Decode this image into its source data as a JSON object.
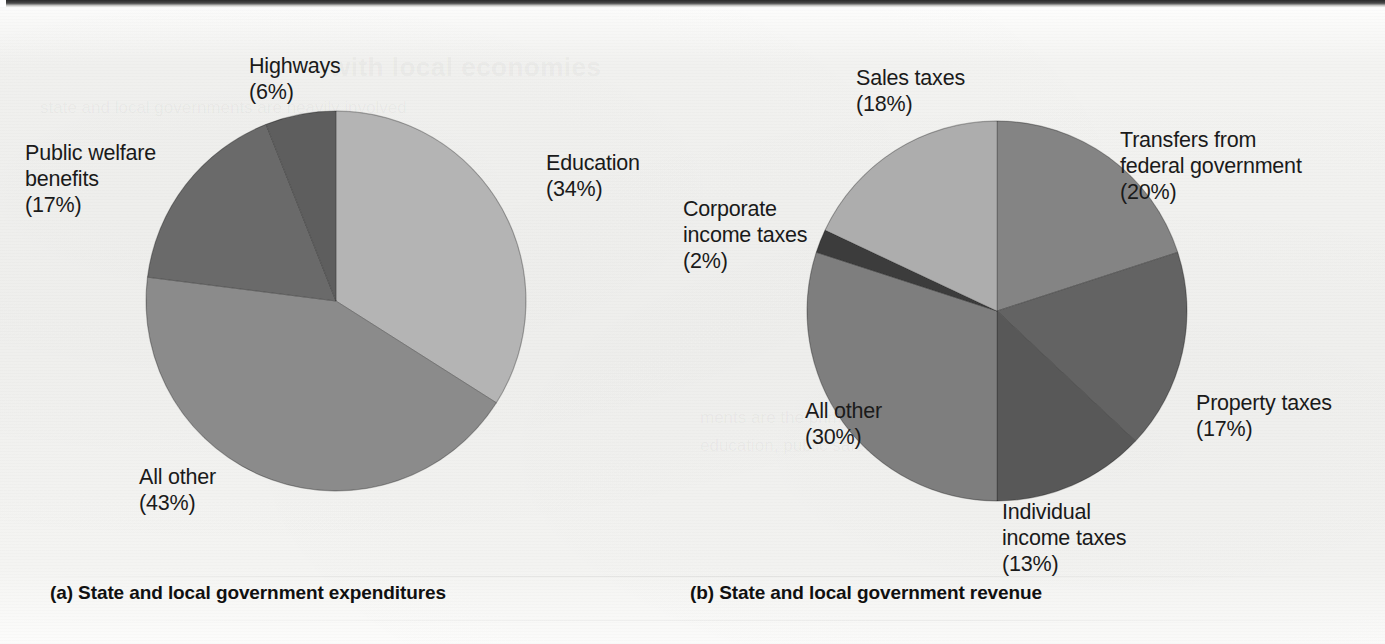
{
  "figure": {
    "background_color": "#f1f1ef",
    "ghost_heading": "with local economies",
    "ghost_line_1": "state and local governments are heavily involved",
    "ghost_line_2": "ments are the primary providers of",
    "ghost_line_3": "education, public safety, and highways."
  },
  "charts": [
    {
      "id": "expenditures",
      "caption_marker": "(a)",
      "caption_text": "State and local government expenditures",
      "center": {
        "x": 336,
        "y": 301
      },
      "radius": 190,
      "chart_data": {
        "type": "pie",
        "title": "(a) State and local government expenditures",
        "categories": [
          "Education",
          "All other",
          "Public welfare benefits",
          "Highways"
        ],
        "values": [
          34,
          43,
          17,
          6
        ],
        "unit": "%",
        "start_angle_deg": 0,
        "direction": "clockwise",
        "colors": [
          "#b4b4b4",
          "#8b8b8b",
          "#6a6a6a",
          "#5e5e5e"
        ],
        "labels": [
          {
            "name": "Education",
            "value": 34,
            "text": "Education\n(34%)"
          },
          {
            "name": "All other",
            "value": 43,
            "text": "All other\n(43%)"
          },
          {
            "name": "Public welfare benefits",
            "value": 17,
            "text": "Public welfare\nbenefits\n(17%)"
          },
          {
            "name": "Highways",
            "value": 6,
            "text": "Highways\n(6%)"
          }
        ]
      }
    },
    {
      "id": "revenue",
      "caption_marker": "(b)",
      "caption_text": "State and local government revenue",
      "center": {
        "x": 997,
        "y": 311
      },
      "radius": 190,
      "chart_data": {
        "type": "pie",
        "title": "(b) State and local government revenue",
        "categories": [
          "Transfers from federal government",
          "Property taxes",
          "Individual income taxes",
          "All other",
          "Corporate income taxes",
          "Sales taxes"
        ],
        "values": [
          20,
          17,
          13,
          30,
          2,
          18
        ],
        "unit": "%",
        "start_angle_deg": 0,
        "direction": "clockwise",
        "colors": [
          "#848484",
          "#636363",
          "#585858",
          "#7e7e7e",
          "#3c3c3c",
          "#adadad"
        ],
        "labels": [
          {
            "name": "Transfers from federal government",
            "value": 20,
            "text": "Transfers from\nfederal government\n(20%)"
          },
          {
            "name": "Property taxes",
            "value": 17,
            "text": "Property taxes\n(17%)"
          },
          {
            "name": "Individual income taxes",
            "value": 13,
            "text": "Individual\nincome taxes\n(13%)"
          },
          {
            "name": "All other",
            "value": 30,
            "text": "All other\n(30%)"
          },
          {
            "name": "Corporate income taxes",
            "value": 2,
            "text": "Corporate\nincome taxes\n(2%)"
          },
          {
            "name": "Sales taxes",
            "value": 18,
            "text": "Sales taxes\n(18%)"
          }
        ]
      }
    }
  ],
  "label_positions": {
    "expenditures": {
      "highways": {
        "left": 249,
        "top": 53
      },
      "education": {
        "left": 546,
        "top": 150
      },
      "public_welfare": {
        "left": 25,
        "top": 140
      },
      "all_other": {
        "left": 139,
        "top": 464
      }
    },
    "revenue": {
      "sales_taxes": {
        "left": 856,
        "top": 65
      },
      "transfers": {
        "left": 1120,
        "top": 127
      },
      "corporate": {
        "left": 683,
        "top": 196
      },
      "property_taxes": {
        "left": 1196,
        "top": 390
      },
      "all_other": {
        "left": 805,
        "top": 398
      },
      "individual": {
        "left": 1002,
        "top": 499
      }
    }
  },
  "caption_positions": {
    "expenditures": {
      "left": 50,
      "top": 582
    },
    "revenue": {
      "left": 690,
      "top": 582
    }
  }
}
